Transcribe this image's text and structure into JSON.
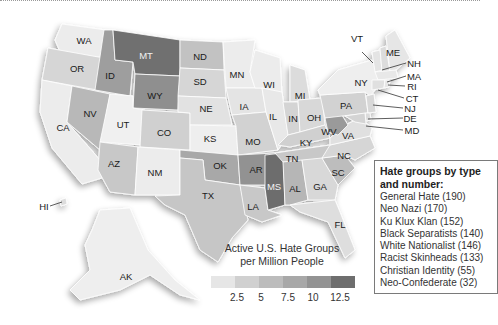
{
  "legend": {
    "title_line1": "Active U.S. Hate Groups",
    "title_line2": "per Million People",
    "scale_colors": [
      "#e6e6e6",
      "#d0d0d0",
      "#bcbcbc",
      "#a8a8a8",
      "#939393",
      "#6e6e6e"
    ],
    "ticks": [
      "2.5",
      "5",
      "7.5",
      "10",
      "12.5"
    ]
  },
  "types_box": {
    "title": "Hate groups by type and number:",
    "items": [
      "General Hate (190)",
      "Neo Nazi (170)",
      "Ku Klux Klan (152)",
      "Black Separatists (140)",
      "White Nationalist (146)",
      "Racist Skinheads (133)",
      "Christian Identity (55)",
      "Neo-Confederate (32)"
    ]
  },
  "states": {
    "WA": "WA",
    "OR": "OR",
    "CA": "CA",
    "ID": "ID",
    "NV": "NV",
    "MT": "MT",
    "WY": "WY",
    "UT": "UT",
    "AZ": "AZ",
    "CO": "CO",
    "NM": "NM",
    "ND": "ND",
    "SD": "SD",
    "NE": "NE",
    "KS": "KS",
    "OK": "OK",
    "TX": "TX",
    "MN": "MN",
    "IA": "IA",
    "MO": "MO",
    "AR": "AR",
    "LA": "LA",
    "WI": "WI",
    "IL": "IL",
    "MS": "MS",
    "MI": "MI",
    "IN": "IN",
    "OH": "OH",
    "KY": "KY",
    "TN": "TN",
    "AL": "AL",
    "GA": "GA",
    "FL": "FL",
    "SC": "SC",
    "NC": "NC",
    "VA": "VA",
    "WV": "WV",
    "PA": "PA",
    "NY": "NY",
    "VT": "VT",
    "ME": "ME",
    "NH": "NH",
    "MA": "MA",
    "RI": "RI",
    "CT": "CT",
    "NJ": "NJ",
    "DE": "DE",
    "MD": "MD",
    "AK": "AK",
    "HI": "HI"
  }
}
